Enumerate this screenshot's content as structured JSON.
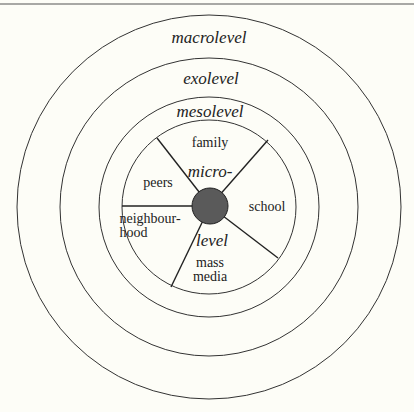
{
  "diagram": {
    "type": "concentric-levels",
    "colors": {
      "background": "#fdfdf7",
      "stroke": "#333333",
      "core_fill": "#5a5a5a"
    },
    "levels": {
      "macro": "macrolevel",
      "exo": "exolevel",
      "meso": "mesolevel",
      "micro_top": "micro-",
      "micro_bottom": "level"
    },
    "micro_segments": {
      "family": "family",
      "school": "school",
      "mass_media_1": "mass",
      "mass_media_2": "media",
      "neighbourhood_1": "neighbour-",
      "neighbourhood_2": "hood",
      "peers": "peers"
    }
  }
}
